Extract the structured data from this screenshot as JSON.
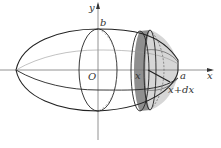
{
  "figure": {
    "type": "ellipsoid-of-revolution-volume-slice",
    "labels": {
      "y_axis": "y",
      "x_axis": "x",
      "origin": "O",
      "b": "b",
      "a": "a",
      "x": "x",
      "x_plus_dx": "x+dx"
    },
    "colors": {
      "outline": "#222222",
      "axis": "#777777",
      "guide": "#888888",
      "slice_dark": "#8f8f8f",
      "cap_light": "#d6d6d6",
      "background": "#ffffff"
    }
  }
}
